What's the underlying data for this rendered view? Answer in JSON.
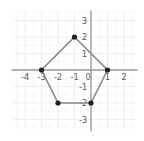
{
  "chart_data": {
    "type": "scatter",
    "title": "",
    "xlabel": "",
    "ylabel": "",
    "xlim": [
      -4.7,
      2.7
    ],
    "ylim": [
      -3.6,
      3.5
    ],
    "grid": true,
    "x_ticks": [
      -4,
      -3,
      -2,
      -1,
      0,
      1,
      2
    ],
    "x_tick_labels": [
      "-4",
      "-3",
      "-2",
      "-1",
      "0",
      "1",
      "2"
    ],
    "y_ticks": [
      3,
      2,
      1,
      -1,
      -2,
      -3
    ],
    "y_tick_labels": [
      "3",
      "2",
      "1",
      "-1",
      "-2",
      "-3"
    ],
    "polygon": {
      "name": "pentagon",
      "closed": true,
      "vertices": [
        {
          "x": -1,
          "y": 2
        },
        {
          "x": 1,
          "y": 0
        },
        {
          "x": 0,
          "y": -2
        },
        {
          "x": -2,
          "y": -2
        },
        {
          "x": -3,
          "y": 0
        }
      ]
    },
    "colors": {
      "grid": "#eeeeee",
      "axis": "#999999",
      "edge": "#888888",
      "vertex": "#222222"
    }
  }
}
